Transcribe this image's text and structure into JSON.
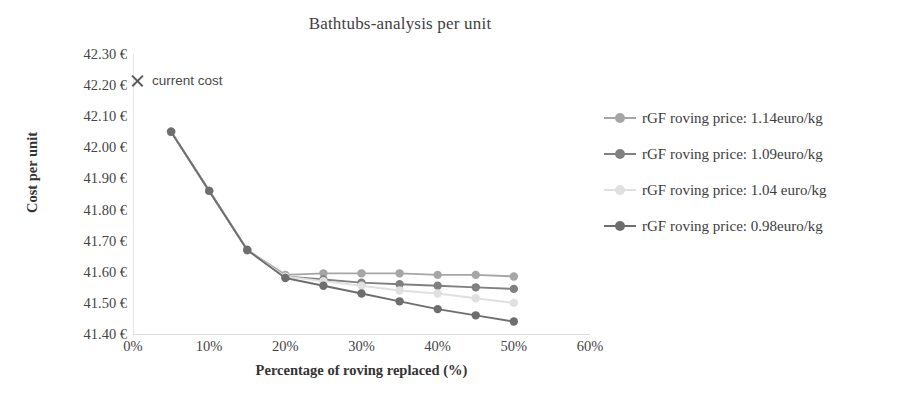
{
  "chart_data": {
    "type": "line",
    "title": "Bathtubs-analysis per unit",
    "xlabel": "Percentage of roving replaced (%)",
    "ylabel": "Cost per unit",
    "xlim": [
      0,
      60
    ],
    "ylim": [
      41.4,
      42.3
    ],
    "xticks": [
      "0%",
      "10%",
      "20%",
      "30%",
      "40%",
      "50%",
      "60%"
    ],
    "xtick_values": [
      0,
      10,
      20,
      30,
      40,
      50,
      60
    ],
    "yticks": [
      "41.40 €",
      "41.50 €",
      "41.60 €",
      "41.70 €",
      "41.80 €",
      "41.90 €",
      "42.00 €",
      "42.10 €",
      "42.20 €",
      "42.30 €"
    ],
    "ytick_values": [
      41.4,
      41.5,
      41.6,
      41.7,
      41.8,
      41.9,
      42.0,
      42.1,
      42.2,
      42.3
    ],
    "grid": false,
    "legend_position": "right",
    "x": [
      5,
      10,
      15,
      20,
      25,
      30,
      35,
      40,
      45,
      50
    ],
    "series": [
      {
        "name": "rGF roving price: 1.14euro/kg",
        "color": "#a6a6a6",
        "values": [
          42.05,
          41.86,
          41.67,
          41.59,
          41.595,
          41.595,
          41.595,
          41.59,
          41.59,
          41.585
        ]
      },
      {
        "name": "rGF roving price: 1.09euro/kg",
        "color": "#808080",
        "values": [
          42.05,
          41.86,
          41.67,
          41.585,
          41.575,
          41.565,
          41.56,
          41.555,
          41.55,
          41.545
        ]
      },
      {
        "name": "rGF roving price: 1.04 euro/kg",
        "color": "#e0e0e0",
        "values": [
          42.05,
          41.86,
          41.67,
          41.585,
          41.57,
          41.555,
          41.54,
          41.53,
          41.515,
          41.5
        ]
      },
      {
        "name": "rGF roving price: 0.98euro/kg",
        "color": "#6e6e6e",
        "values": [
          42.05,
          41.86,
          41.67,
          41.58,
          41.555,
          41.53,
          41.505,
          41.48,
          41.46,
          41.44
        ]
      }
    ],
    "annotation": {
      "marker": "x-marker-icon",
      "label": "current cost",
      "x": 0,
      "y": 42.2,
      "color": "#5a5a5a"
    }
  }
}
